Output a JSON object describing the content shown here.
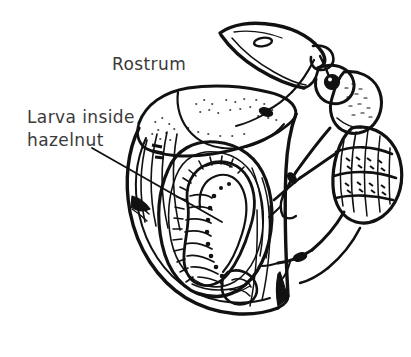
{
  "figure": {
    "kind": "line-drawing",
    "background_color": "#ffffff",
    "ink_color": "#111111",
    "label_color": "#3a3a3a",
    "labels": {
      "rostrum": "Rostrum",
      "larva_line1": "Larva inside",
      "larva_line2": "hazelnut"
    },
    "parts": [
      "rostrum",
      "antenna",
      "eye",
      "pronotum",
      "elytra",
      "legs",
      "hazelnut-husk",
      "hazelnut-shell",
      "nut-cavity",
      "larva"
    ]
  }
}
